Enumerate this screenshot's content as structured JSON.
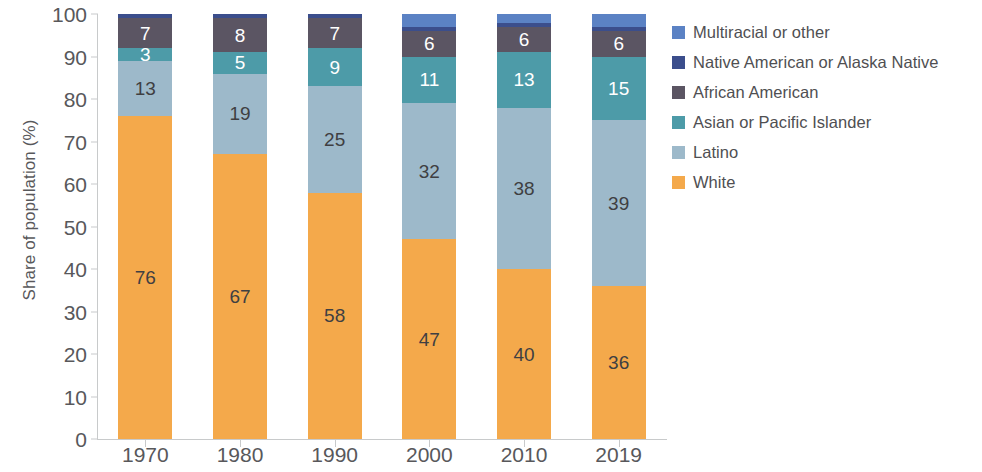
{
  "chart_data": {
    "type": "bar",
    "subtype": "stacked-bar-100-percent",
    "title": "",
    "xlabel": "",
    "ylabel": "Share of population (%)",
    "ylim": [
      0,
      100
    ],
    "yticks": [
      0,
      10,
      20,
      30,
      40,
      50,
      60,
      70,
      80,
      90,
      100
    ],
    "ytick_labels": [
      "0",
      "10",
      "20",
      "30",
      "40",
      "50",
      "60",
      "70",
      "80",
      "90",
      "100"
    ],
    "grid": false,
    "legend_position": "right",
    "categories": [
      "1970",
      "1980",
      "1990",
      "2000",
      "2010",
      "2019"
    ],
    "stack_order_bottom_to_top": [
      "White",
      "Latino",
      "Asian or Pacific Islander",
      "African American",
      "Native American or Alaska Native",
      "Multiracial or other"
    ],
    "series": [
      {
        "name": "White",
        "color": "#f4a94b",
        "label_color": "dark",
        "values": [
          76,
          67,
          58,
          47,
          40,
          36
        ],
        "labels": [
          "76",
          "67",
          "58",
          "47",
          "40",
          "36"
        ]
      },
      {
        "name": "Latino",
        "color": "#9db9ca",
        "label_color": "dark",
        "values": [
          13,
          19,
          25,
          32,
          38,
          39
        ],
        "labels": [
          "13",
          "19",
          "25",
          "32",
          "38",
          "39"
        ]
      },
      {
        "name": "Asian or Pacific Islander",
        "color": "#4d9ba8",
        "label_color": "light",
        "values": [
          3,
          5,
          9,
          11,
          13,
          15
        ],
        "labels": [
          "3",
          "5",
          "9",
          "11",
          "13",
          "15"
        ]
      },
      {
        "name": "African American",
        "color": "#5b5563",
        "label_color": "light",
        "values": [
          7,
          8,
          7,
          6,
          6,
          6
        ],
        "labels": [
          "7",
          "8",
          "7",
          "6",
          "6",
          "6"
        ]
      },
      {
        "name": "Native American or Alaska Native",
        "color": "#3b4e8c",
        "label_color": "light",
        "values": [
          1,
          1,
          1,
          1,
          1,
          1
        ],
        "labels": [
          "",
          "",
          "",
          "",
          "",
          ""
        ]
      },
      {
        "name": "Multiracial or other",
        "color": "#5b82c4",
        "label_color": "light",
        "values": [
          0,
          0,
          0,
          3,
          2,
          3
        ],
        "labels": [
          "",
          "",
          "",
          "",
          "",
          ""
        ]
      }
    ],
    "legend_entries": [
      {
        "label": "Multiracial or other",
        "color": "#5b82c4"
      },
      {
        "label": "Native American or Alaska Native",
        "color": "#3b4e8c"
      },
      {
        "label": "African American",
        "color": "#5b5563"
      },
      {
        "label": "Asian or Pacific Islander",
        "color": "#4d9ba8"
      },
      {
        "label": "Latino",
        "color": "#9db9ca"
      },
      {
        "label": "White",
        "color": "#f4a94b"
      }
    ],
    "axis_color": "#c8cacb",
    "text_color": "#58585b"
  }
}
